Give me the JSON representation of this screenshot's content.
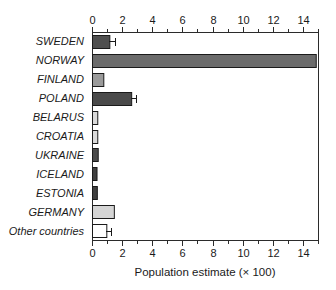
{
  "chart_data": {
    "type": "bar",
    "orientation": "horizontal",
    "title": "",
    "subtitle": "",
    "xlabel": "Population estimate (× 100)",
    "ylabel": "",
    "xlim": [
      0,
      15
    ],
    "ylim": [
      0,
      11
    ],
    "grid": false,
    "legend": null,
    "x_ticks": [
      0,
      2,
      4,
      6,
      8,
      10,
      12,
      14
    ],
    "x_tick_labels": [
      "0",
      "2",
      "4",
      "6",
      "8",
      "10",
      "12",
      "14"
    ],
    "x_minor_ticks": [
      1,
      3,
      5,
      7,
      9,
      11,
      13,
      15
    ],
    "axes_shown": [
      "top",
      "bottom",
      "left",
      "right"
    ],
    "categories": [
      "SWEDEN",
      "NORWAY",
      "FINLAND",
      "POLAND",
      "BELARUS",
      "CROATIA",
      "UKRAINE",
      "ICELAND",
      "ESTONIA",
      "GERMANY",
      "Other countries"
    ],
    "values": [
      1.15,
      14.85,
      0.75,
      2.6,
      0.35,
      0.35,
      0.38,
      0.3,
      0.32,
      1.45,
      0.95
    ],
    "error_upper": [
      0.4,
      0,
      0,
      0.35,
      0,
      0,
      0,
      0,
      0,
      0,
      0.3
    ],
    "bar_colors": [
      "#4f4f4f",
      "#6b6b6b",
      "#9a9a9a",
      "#4a4a4a",
      "#d9d9d9",
      "#d9d9d9",
      "#4a4a4a",
      "#3f3f3f",
      "#3f3f3f",
      "#d5d5d5",
      "#ffffff"
    ],
    "bar_edge_color": "#1a1a1a",
    "series": [
      {
        "name": "Population estimate",
        "values": [
          1.15,
          14.85,
          0.75,
          2.6,
          0.35,
          0.35,
          0.38,
          0.3,
          0.32,
          1.45,
          0.95
        ]
      }
    ]
  }
}
